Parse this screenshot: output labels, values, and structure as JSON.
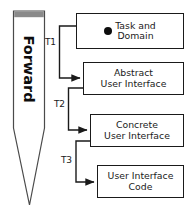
{
  "diagram": {
    "arrow": {
      "label": "Forward",
      "direction": "downward",
      "cap_color": "#8a8a8a",
      "body_color": "#ffffff",
      "stroke_color": "#4a4a4a"
    },
    "nodes": [
      {
        "id": "task-and-domain",
        "label": "Task and\nDomain",
        "has_bullet": true,
        "bullet_color": "#0d0d0d"
      },
      {
        "id": "abstract-ui",
        "label": "Abstract\nUser Interface",
        "has_bullet": false,
        "bullet_color": ""
      },
      {
        "id": "concrete-ui",
        "label": "Concrete\nUser Interface",
        "has_bullet": false,
        "bullet_color": ""
      },
      {
        "id": "ui-code",
        "label": "User Interface\nCode",
        "has_bullet": false,
        "bullet_color": ""
      }
    ],
    "edges": [
      {
        "id": "t1",
        "label": "T1",
        "from": "task-and-domain",
        "to": "abstract-ui"
      },
      {
        "id": "t2",
        "label": "T2",
        "from": "abstract-ui",
        "to": "concrete-ui"
      },
      {
        "id": "t3",
        "label": "T3",
        "from": "concrete-ui",
        "to": "ui-code"
      }
    ],
    "colors": {
      "stroke": "#1a1a1a",
      "background": "#ffffff",
      "text": "#1a1a1a"
    }
  }
}
